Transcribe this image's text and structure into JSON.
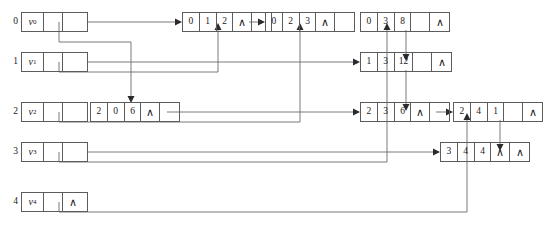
{
  "diagram": {
    "caret_glyph": "∧",
    "head_nodes": [
      {
        "index": "0",
        "label_v": "v",
        "label_sub": "0",
        "cell2": "ptr",
        "cell3": "ptr"
      },
      {
        "index": "1",
        "label_v": "v",
        "label_sub": "1",
        "cell2": "ptr",
        "cell3": "ptr"
      },
      {
        "index": "2",
        "label_v": "v",
        "label_sub": "2",
        "cell2": "ptr",
        "cell3": "blank"
      },
      {
        "index": "3",
        "label_v": "v",
        "label_sub": "3",
        "cell2": "ptr",
        "cell3": "ptr"
      },
      {
        "index": "4",
        "label_v": "v",
        "label_sub": "4",
        "cell2": "ptr",
        "cell3": "caret"
      }
    ],
    "data_nodes": [
      {
        "id": "n012",
        "row": "0",
        "col": "1",
        "val": "2",
        "c4": "∧",
        "c5": "ptr"
      },
      {
        "id": "n023",
        "row": "0",
        "col": "2",
        "val": "3",
        "c4": "∧",
        "c5": "blank"
      },
      {
        "id": "n038",
        "row": "0",
        "col": "3",
        "val": "8",
        "c4": "ptr",
        "c5": "∧"
      },
      {
        "id": "n1312",
        "row": "1",
        "col": "3",
        "val": "12",
        "c4": "ptr",
        "c5": "∧"
      },
      {
        "id": "n206",
        "row": "2",
        "col": "0",
        "val": "6",
        "c4": "∧",
        "c5": "ptr"
      },
      {
        "id": "n236",
        "row": "2",
        "col": "3",
        "val": "6",
        "c4": "∧",
        "c5": "ptr"
      },
      {
        "id": "n241",
        "row": "2",
        "col": "4",
        "val": "1",
        "c4": "ptr",
        "c5": "∧"
      },
      {
        "id": "n344",
        "row": "3",
        "col": "4",
        "val": "4",
        "c4": "∧",
        "c5": "∧"
      }
    ]
  }
}
